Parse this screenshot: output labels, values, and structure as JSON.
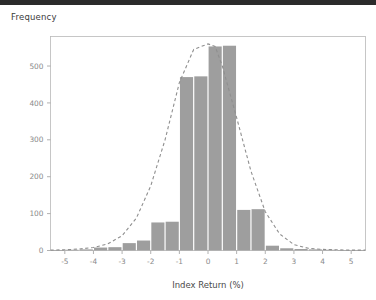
{
  "window": {
    "top_band_color": "#2b2b2b"
  },
  "chart_data": {
    "type": "bar",
    "title": "",
    "ylabel": "Frequency",
    "xlabel": "Index Return (%)",
    "xlim": [
      -5.5,
      5.5
    ],
    "ylim": [
      0,
      580
    ],
    "xticks": [
      -5,
      -4,
      -3,
      -2,
      -1,
      0,
      1,
      2,
      3,
      4,
      5
    ],
    "xtick_labels": [
      "-5",
      "-4",
      "-3",
      "-2",
      "-1",
      "0",
      "1",
      "2",
      "3",
      "4",
      "5"
    ],
    "yticks": [
      0,
      100,
      200,
      300,
      400,
      500
    ],
    "ytick_labels": [
      "0",
      "100",
      "200",
      "300",
      "400",
      "500"
    ],
    "grid": false,
    "legend": null,
    "bar_color": "#9e9e9e",
    "bin_width": 0.5,
    "bin_starts": [
      -5.5,
      -5.0,
      -4.5,
      -4.0,
      -3.5,
      -3.0,
      -2.5,
      -2.0,
      -1.5,
      -1.0,
      -0.5,
      0.0,
      0.5,
      1.0,
      1.5,
      2.0,
      2.5,
      3.0,
      3.5,
      4.0,
      4.5,
      5.0
    ],
    "values": [
      1,
      2,
      3,
      8,
      9,
      20,
      27,
      76,
      78,
      470,
      472,
      553,
      555,
      110,
      112,
      13,
      6,
      4,
      3,
      2,
      1,
      1
    ],
    "categories": [
      "-5.5",
      "-5.0",
      "-4.5",
      "-4.0",
      "-3.5",
      "-3.0",
      "-2.5",
      "-2.0",
      "-1.5",
      "-1.0",
      "-0.5",
      "0.0",
      "0.5",
      "1.0",
      "1.5",
      "2.0",
      "2.5",
      "3.0",
      "3.5",
      "4.0",
      "4.5",
      "5.0"
    ],
    "overlay": {
      "name": "normal-fit",
      "style": "dashed",
      "color": "#8f8f8f",
      "x": [
        -5.5,
        -5.0,
        -4.5,
        -4.0,
        -3.5,
        -3.0,
        -2.5,
        -2.0,
        -1.5,
        -1.0,
        -0.5,
        0.0,
        0.25,
        0.5,
        1.0,
        1.5,
        2.0,
        2.5,
        3.0,
        3.5,
        4.0,
        4.5,
        5.0,
        5.5
      ],
      "y": [
        1,
        2,
        4,
        8,
        18,
        40,
        88,
        175,
        300,
        455,
        545,
        560,
        553,
        500,
        360,
        215,
        105,
        45,
        16,
        6,
        3,
        2,
        1,
        1
      ]
    }
  }
}
